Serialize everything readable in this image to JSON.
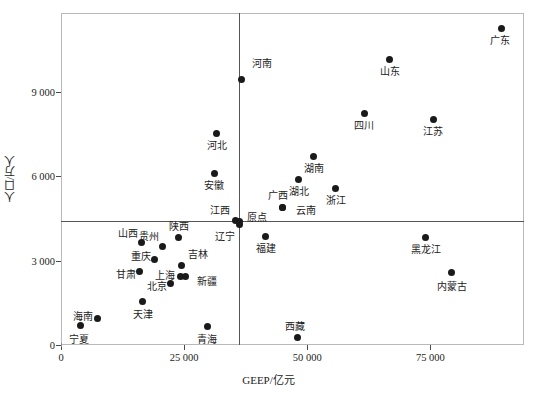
{
  "chart_data": {
    "type": "scatter",
    "title": "",
    "xlabel": "GEEP/亿元",
    "ylabel": "人口/万人",
    "xlim": [
      0,
      94000
    ],
    "ylim": [
      0,
      11800
    ],
    "xticks": [
      0,
      25000,
      50000,
      75000
    ],
    "xtick_labels": [
      "0",
      "25 000",
      "50 000",
      "75 000"
    ],
    "yticks": [
      0,
      3000,
      6000,
      9000
    ],
    "ytick_labels": [
      "0",
      "3 000",
      "6 000",
      "9 000"
    ],
    "grid": false,
    "legend": "none",
    "reference_lines": {
      "vertical_x": 36200,
      "horizontal_y": 4400,
      "origin_label": "原点"
    },
    "points": [
      {
        "name": "广东",
        "x": 89500,
        "y": 11250,
        "label_dx": -2,
        "label_dy": 12,
        "label_align": "center"
      },
      {
        "name": "山东",
        "x": 66700,
        "y": 10150,
        "label_dx": 0,
        "label_dy": 12,
        "label_align": "center"
      },
      {
        "name": "河南",
        "x": 36700,
        "y": 9440,
        "label_dx": 6,
        "label_dy": -16,
        "label_align": "left"
      },
      {
        "name": "四川",
        "x": 61600,
        "y": 8230,
        "label_dx": 0,
        "label_dy": 12,
        "label_align": "center"
      },
      {
        "name": "江苏",
        "x": 75600,
        "y": 8000,
        "label_dx": 0,
        "label_dy": 12,
        "label_align": "center"
      },
      {
        "name": "河北",
        "x": 31600,
        "y": 7500,
        "label_dx": 0,
        "label_dy": 12,
        "label_align": "center"
      },
      {
        "name": "湖南",
        "x": 51300,
        "y": 6700,
        "label_dx": 0,
        "label_dy": 12,
        "label_align": "center"
      },
      {
        "name": "安徽",
        "x": 31100,
        "y": 6100,
        "label_dx": 0,
        "label_dy": 12,
        "label_align": "center"
      },
      {
        "name": "湖北",
        "x": 48300,
        "y": 5870,
        "label_dx": 0,
        "label_dy": 12,
        "label_align": "center"
      },
      {
        "name": "浙江",
        "x": 55800,
        "y": 5560,
        "label_dx": 0,
        "label_dy": 12,
        "label_align": "center"
      },
      {
        "name": "广西",
        "x": 44900,
        "y": 4880,
        "label_dx": -4,
        "label_dy": -12,
        "label_align": "center"
      },
      {
        "name": "云南",
        "x": 44900,
        "y": 4880,
        "label_dx": 10,
        "label_dy": 3,
        "label_align": "left"
      },
      {
        "name": "江西",
        "x": 35400,
        "y": 4420,
        "label_dx": -9,
        "label_dy": -10,
        "label_align": "right"
      },
      {
        "name": "原点",
        "x": 36200,
        "y": 4400,
        "label_dx": 4,
        "label_dy": -4,
        "label_align": "left"
      },
      {
        "name": "辽宁",
        "x": 36200,
        "y": 4290,
        "label_dx": -8,
        "label_dy": 12,
        "label_align": "right"
      },
      {
        "name": "陕西",
        "x": 23900,
        "y": 3830,
        "label_dx": 0,
        "label_dy": -11,
        "label_align": "center"
      },
      {
        "name": "黑龙江",
        "x": 74100,
        "y": 3810,
        "label_dx": 0,
        "label_dy": 12,
        "label_align": "center"
      },
      {
        "name": "福建",
        "x": 41600,
        "y": 3860,
        "label_dx": 0,
        "label_dy": 12,
        "label_align": "center"
      },
      {
        "name": "山西",
        "x": 16400,
        "y": 3630,
        "label_dx": -8,
        "label_dy": -9,
        "label_align": "right"
      },
      {
        "name": "贵州",
        "x": 20600,
        "y": 3490,
        "label_dx": -7,
        "label_dy": -10,
        "label_align": "right"
      },
      {
        "name": "重庆",
        "x": 19000,
        "y": 3050,
        "label_dx": -8,
        "label_dy": -3,
        "label_align": "right"
      },
      {
        "name": "吉林",
        "x": 24400,
        "y": 2810,
        "label_dx": 3,
        "label_dy": -11,
        "label_align": "left"
      },
      {
        "name": "甘肃",
        "x": 16000,
        "y": 2620,
        "label_dx": -8,
        "label_dy": 3,
        "label_align": "right"
      },
      {
        "name": "内蒙古",
        "x": 79300,
        "y": 2560,
        "label_dx": 0,
        "label_dy": 14,
        "label_align": "center"
      },
      {
        "name": "新疆",
        "x": 25200,
        "y": 2440,
        "label_dx": 8,
        "label_dy": 5,
        "label_align": "left"
      },
      {
        "name": "上海",
        "x": 24200,
        "y": 2420,
        "label_dx": -9,
        "label_dy": -1,
        "label_align": "right"
      },
      {
        "name": "北京",
        "x": 22300,
        "y": 2170,
        "label_dx": -8,
        "label_dy": 3,
        "label_align": "right"
      },
      {
        "name": "天津",
        "x": 16600,
        "y": 1560,
        "label_dx": 0,
        "label_dy": 13,
        "label_align": "center"
      },
      {
        "name": "海南",
        "x": 7400,
        "y": 925,
        "label_dx": -8,
        "label_dy": -2,
        "label_align": "right"
      },
      {
        "name": "青海",
        "x": 29700,
        "y": 640,
        "label_dx": 0,
        "label_dy": 13,
        "label_align": "center"
      },
      {
        "name": "宁夏",
        "x": 4000,
        "y": 690,
        "label_dx": -2,
        "label_dy": 14,
        "label_align": "center"
      },
      {
        "name": "西藏",
        "x": 48000,
        "y": 280,
        "label_dx": -2,
        "label_dy": -11,
        "label_align": "center"
      }
    ]
  }
}
